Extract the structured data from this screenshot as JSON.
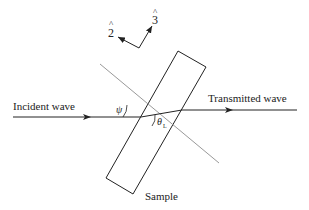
{
  "diagram": {
    "labels": {
      "incident": "Incident wave",
      "transmitted": "Transmitted wave",
      "sample": "Sample",
      "psi": "ψ",
      "theta": "θ",
      "theta_sub": "L",
      "axis2": "2",
      "axis3": "3",
      "hat": "^"
    },
    "colors": {
      "line": "#222222",
      "normal_line": "#999999"
    }
  }
}
